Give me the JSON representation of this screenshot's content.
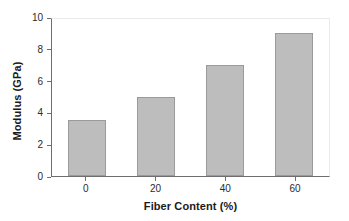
{
  "chart_data": {
    "type": "bar",
    "title": "",
    "subtitle": "",
    "xlabel": "Fiber Content (%)",
    "ylabel": "Modulus (GPa)",
    "categories": [
      "0",
      "20",
      "40",
      "60"
    ],
    "values": [
      3.5,
      5.0,
      7.0,
      9.0
    ],
    "series": [
      {
        "name": "Modulus",
        "values": [
          3.5,
          5.0,
          7.0,
          9.0
        ]
      }
    ],
    "ylim": [
      0,
      10
    ],
    "y_ticks": [
      "0",
      "2",
      "4",
      "6",
      "8",
      "10"
    ],
    "y_tick_values": [
      0,
      2,
      4,
      6,
      8,
      10
    ],
    "x_ticks": [
      "0",
      "20",
      "40",
      "60"
    ],
    "grid": false,
    "legend": false,
    "legend_position": "none",
    "annotations": [],
    "colors": {
      "bar_fill": "#bdbdbd",
      "bar_stroke": "#9a9a9a",
      "axis": "#6e6e6e",
      "text": "#1a1a1a",
      "background": "#ffffff"
    }
  }
}
